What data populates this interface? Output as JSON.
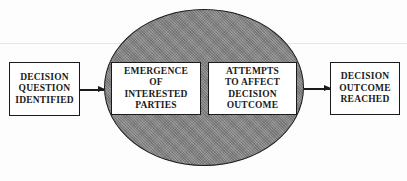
{
  "diagram": {
    "type": "flow",
    "nodes": {
      "start": {
        "lines": [
          "DECISION",
          "QUESTION",
          "IDENTIFIED"
        ]
      },
      "inner_left": {
        "lines": [
          "EMERGENCE",
          "OF",
          "INTERESTED",
          "PARTIES"
        ]
      },
      "inner_right": {
        "lines": [
          "ATTEMPTS",
          "TO AFFECT",
          "DECISION",
          "OUTCOME"
        ]
      },
      "end": {
        "lines": [
          "DECISION",
          "OUTCOME",
          "REACHED"
        ]
      }
    },
    "container": {
      "shape": "ellipse",
      "fill": "#8c8c8c",
      "pattern": "stippled"
    },
    "edges": [
      {
        "from": "start",
        "to": "container"
      },
      {
        "from": "container",
        "to": "end"
      }
    ],
    "colors": {
      "stroke": "#1a1a1a",
      "box_fill": "#ffffff",
      "background": "#fdfdfd"
    }
  }
}
